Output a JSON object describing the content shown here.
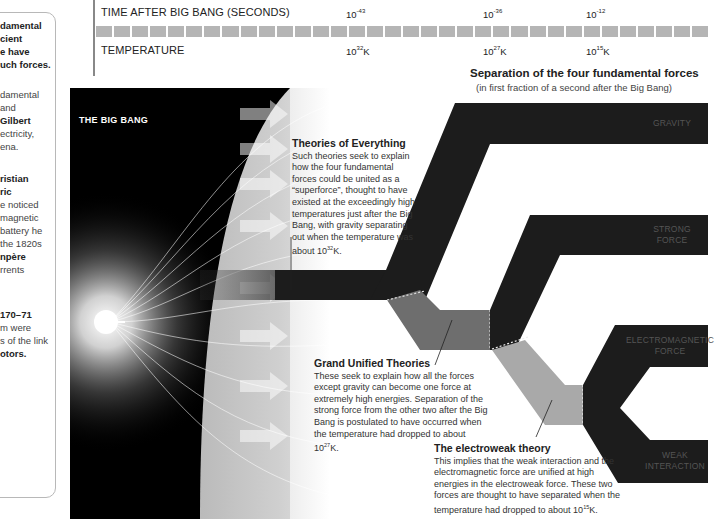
{
  "sidebar": {
    "lines": [
      {
        "text": "damental",
        "bold": true,
        "top": 19
      },
      {
        "text": "cient",
        "bold": true,
        "top": 32
      },
      {
        "text": "e have",
        "bold": true,
        "top": 45
      },
      {
        "text": "uch forces.",
        "bold": true,
        "top": 58
      },
      {
        "text": "damental",
        "bold": false,
        "top": 88
      },
      {
        "text": "and",
        "bold": false,
        "top": 101
      },
      {
        "text": "Gilbert",
        "bold": true,
        "top": 114
      },
      {
        "text": "ectricity,",
        "bold": false,
        "top": 127
      },
      {
        "text": "ena.",
        "bold": false,
        "top": 140
      },
      {
        "text": "ristian",
        "bold": true,
        "top": 172
      },
      {
        "text": "ric",
        "bold": true,
        "top": 185
      },
      {
        "text": "e noticed",
        "bold": false,
        "top": 198
      },
      {
        "text": "magnetic",
        "bold": false,
        "top": 211
      },
      {
        "text": "battery he",
        "bold": false,
        "top": 224
      },
      {
        "text": "the 1820s",
        "bold": false,
        "top": 237
      },
      {
        "text": "npère",
        "bold": true,
        "top": 250
      },
      {
        "text": "rrents",
        "bold": false,
        "top": 263
      },
      {
        "text": "170–71",
        "bold": true,
        "top": 308
      },
      {
        "text": "m were",
        "bold": false,
        "top": 321
      },
      {
        "text": "s of the link",
        "bold": false,
        "top": 334
      },
      {
        "text": "otors.",
        "bold": true,
        "top": 347
      }
    ]
  },
  "timeline": {
    "time_label": "TIME AFTER BIG BANG (SECONDS)",
    "temp_label": "TEMPERATURE",
    "time_ticks": [
      {
        "base": "10",
        "exp": "-43",
        "x": 346
      },
      {
        "base": "10",
        "exp": "-36",
        "x": 483
      },
      {
        "base": "10",
        "exp": "-12",
        "x": 586
      }
    ],
    "temp_ticks": [
      {
        "base": "10",
        "exp": "32",
        "unit": "K",
        "x": 346
      },
      {
        "base": "10",
        "exp": "27",
        "unit": "K",
        "x": 483
      },
      {
        "base": "10",
        "exp": "15",
        "unit": "K",
        "x": 586
      }
    ]
  },
  "caption": {
    "title": "Separation of the four fundamental forces",
    "subtitle": "(in first fraction of a second after the Big Bang)"
  },
  "bigbang": {
    "label": "THE BIG BANG"
  },
  "notes": {
    "toe": {
      "title": "Theories of Everything",
      "body_pre": "Such theories seek to explain how the four fundamental forces could be united as a “superforce”, thought to have existed at the exceedingly high temperatures just after the Big Bang, with gravity separating out when the temperature was about 10",
      "exp": "32",
      "body_post": "K."
    },
    "gut": {
      "title": "Grand Unified Theories",
      "body_pre": "These seek to explain how all the forces except gravity can become one force at extremely high energies. Separation of the strong force from the other two after the Big Bang is postulated to have occurred when the temperature had dropped to about 10",
      "exp": "27",
      "body_post": "K."
    },
    "ew": {
      "title": "The electroweak theory",
      "body_pre": "This implies that the weak interaction and the electromagnetic force are unified at high energies in the electroweak force. These two forces are thought to have separated when the temperature had dropped to about 10",
      "exp": "15",
      "body_post": "K."
    }
  },
  "forces": {
    "gravity": "GRAVITY",
    "strong": [
      "STRONG",
      "FORCE"
    ],
    "em": [
      "ELECTROMAGNETIC",
      "FORCE"
    ],
    "weak": [
      "WEAK",
      "INTERACTION"
    ]
  },
  "colors": {
    "band_dark": "#1c1c1c",
    "gut_gray": "#6e6e6e",
    "ew_gray": "#a9a9a9",
    "bar_gray": "#b5b5b5"
  }
}
